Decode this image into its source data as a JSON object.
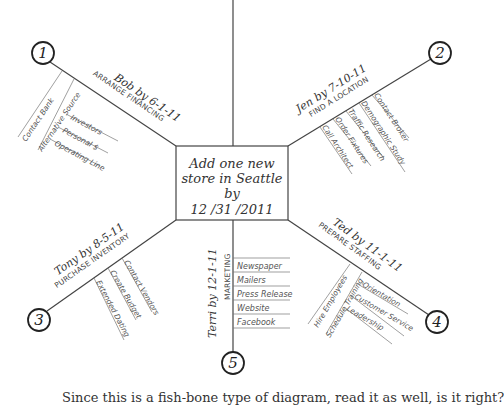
{
  "center": {
    "line1": "Add one new",
    "line2": "store in Seattle",
    "line3": "by",
    "line4": "12 /31 /2011"
  },
  "branches": [
    {
      "number": "1",
      "owner": "Bob by 6-1-11",
      "task": "ARRANGE FINANCING",
      "subtasks": [
        {
          "label": "Contact Bank",
          "children": []
        },
        {
          "label": "Alternative Source",
          "children": [
            "Investors",
            "Personal $",
            "Operating Line"
          ]
        }
      ]
    },
    {
      "number": "2",
      "owner": "Jen by 7-10-11",
      "task": "FIND A LOCATION",
      "subtasks": [
        {
          "label": "Call Architect",
          "children": []
        },
        {
          "label": "Order Fixtures",
          "children": []
        },
        {
          "label": "Traffic Research",
          "children": []
        },
        {
          "label": "Demographic Study",
          "children": []
        },
        {
          "label": "Contact Broker",
          "children": []
        }
      ]
    },
    {
      "number": "3",
      "owner": "Tony by 8-5-11",
      "task": "PURCHASE INVENTORY",
      "subtasks": [
        {
          "label": "Extended Dating",
          "children": []
        },
        {
          "label": "Create Budget",
          "children": []
        },
        {
          "label": "Contact Vendors",
          "children": []
        }
      ]
    },
    {
      "number": "4",
      "owner": "Ted by 11-1-11",
      "task": "PREPARE STAFFING",
      "subtasks": [
        {
          "label": "Hire Employees",
          "children": []
        },
        {
          "label": "Schedule Training",
          "children": [
            "Orientation",
            "Customer Service",
            "Leadership"
          ]
        }
      ]
    },
    {
      "number": "5",
      "owner": "Terri by 12-1-11",
      "task": "MARKETING",
      "subtasks": [
        {
          "label": "Newspaper",
          "children": []
        },
        {
          "label": "Mailers",
          "children": []
        },
        {
          "label": "Press Release",
          "children": []
        },
        {
          "label": "Website",
          "children": []
        },
        {
          "label": "Facebook",
          "children": []
        }
      ]
    }
  ],
  "caption": "Since this is a fish-bone type of diagram, read it as well, is it right?"
}
